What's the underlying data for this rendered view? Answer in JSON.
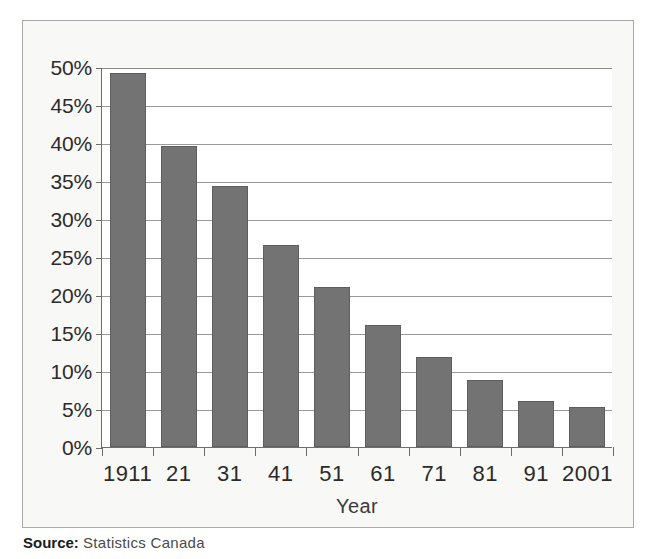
{
  "chart_data": {
    "type": "bar",
    "title": "",
    "subtitle": "",
    "xlabel": "Year",
    "ylabel": "",
    "categories": [
      "1911",
      "21",
      "31",
      "41",
      "51",
      "61",
      "71",
      "81",
      "91",
      "2001"
    ],
    "values": [
      49.2,
      39.6,
      34.4,
      26.6,
      21.0,
      16.0,
      11.9,
      8.8,
      6.1,
      5.3
    ],
    "series": [
      {
        "name": "Share of population",
        "values": [
          49.2,
          39.6,
          34.4,
          26.6,
          21.0,
          16.0,
          11.9,
          8.8,
          6.1,
          5.3
        ]
      }
    ],
    "ylim": [
      0,
      50
    ],
    "ytick_values": [
      0,
      5,
      10,
      15,
      20,
      25,
      30,
      35,
      40,
      45,
      50
    ],
    "ytick_labels": [
      "0%",
      "5%",
      "10%",
      "15%",
      "20%",
      "25%",
      "30%",
      "35%",
      "40%",
      "45%",
      "50%"
    ],
    "xtick_labels": [
      "1911",
      "21",
      "31",
      "41",
      "51",
      "61",
      "71",
      "81",
      "91",
      "2001"
    ],
    "grid": "horizontal",
    "legend": "none",
    "annotations": [],
    "bar_color": "#737373",
    "bar_border_color": "#5e5e5e",
    "plot_background": "#ffffff",
    "panel_background": "#f8f8f6",
    "panel_border_color": "#a9a9a9",
    "axis_color": "#6d6d6d",
    "gridline_color": "#999999",
    "text_color": "#2b2b2b"
  },
  "source": {
    "label": "Source:",
    "text": "Statistics Canada"
  }
}
